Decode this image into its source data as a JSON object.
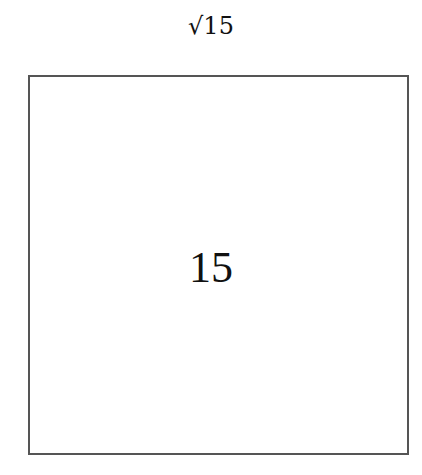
{
  "diagram": {
    "shape": "square",
    "side_label": "√15",
    "area_label": "15"
  }
}
